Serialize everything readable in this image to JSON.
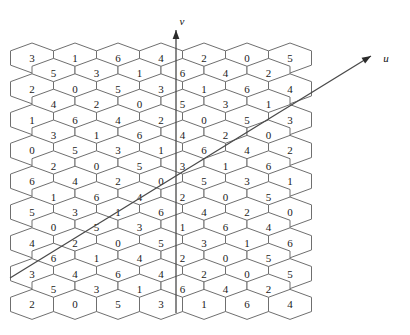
{
  "figure": {
    "background_color": "#ffffff",
    "hex_stroke_color": "#6f6f6f",
    "hex_fill_color": "#ffffff",
    "axis_color": "#4a4a4a",
    "text_color": "#1a1a1a"
  },
  "axes": {
    "v": {
      "label": "v",
      "label_x": 182,
      "label_y": 21,
      "x1": 176,
      "y1": 313,
      "x2": 176,
      "y2": 30,
      "arrow": "up"
    },
    "u": {
      "label": "u",
      "label_x": 386,
      "label_y": 58,
      "x1": 10,
      "y1": 278,
      "x2": 371,
      "y2": 56,
      "arrow": "up-right"
    }
  },
  "lattice": {
    "type": "pointy-top-hexagon-grid",
    "columns_odd": 7,
    "columns_even": 6,
    "rows": 17,
    "hex_width": 43,
    "hex_height": 30,
    "row_step": 15.4,
    "origin_x": 32,
    "origin_y": 58,
    "rows_data": [
      {
        "index": 0,
        "offset": "odd",
        "values": [
          3,
          1,
          6,
          4,
          2,
          0,
          5
        ]
      },
      {
        "index": 1,
        "offset": "even",
        "values": [
          5,
          3,
          1,
          6,
          4,
          2
        ]
      },
      {
        "index": 2,
        "offset": "odd",
        "values": [
          2,
          0,
          5,
          3,
          1,
          6,
          4
        ]
      },
      {
        "index": 3,
        "offset": "even",
        "values": [
          4,
          2,
          0,
          5,
          3,
          1
        ]
      },
      {
        "index": 4,
        "offset": "odd",
        "values": [
          1,
          6,
          4,
          2,
          0,
          5,
          3
        ]
      },
      {
        "index": 5,
        "offset": "even",
        "values": [
          3,
          1,
          6,
          4,
          2,
          0
        ]
      },
      {
        "index": 6,
        "offset": "odd",
        "values": [
          0,
          5,
          3,
          1,
          6,
          4,
          2
        ]
      },
      {
        "index": 7,
        "offset": "even",
        "values": [
          2,
          0,
          5,
          3,
          1,
          6
        ]
      },
      {
        "index": 8,
        "offset": "odd",
        "values": [
          6,
          4,
          2,
          0,
          5,
          3,
          1
        ]
      },
      {
        "index": 9,
        "offset": "even",
        "values": [
          1,
          6,
          4,
          2,
          0,
          5
        ]
      },
      {
        "index": 10,
        "offset": "odd",
        "values": [
          5,
          3,
          1,
          6,
          4,
          2,
          0
        ]
      },
      {
        "index": 11,
        "offset": "even",
        "values": [
          0,
          5,
          3,
          1,
          6,
          4
        ]
      },
      {
        "index": 12,
        "offset": "odd",
        "values": [
          4,
          2,
          0,
          5,
          3,
          1,
          6
        ]
      },
      {
        "index": 13,
        "offset": "even",
        "values": [
          6,
          1,
          4,
          2,
          0,
          5
        ]
      },
      {
        "index": 14,
        "offset": "odd",
        "values": [
          3,
          4,
          6,
          4,
          2,
          0,
          5
        ]
      },
      {
        "index": 15,
        "offset": "even",
        "values": [
          5,
          3,
          1,
          6,
          4,
          2
        ]
      },
      {
        "index": 16,
        "offset": "odd",
        "values": [
          2,
          0,
          5,
          3,
          1,
          6,
          4
        ]
      }
    ]
  }
}
